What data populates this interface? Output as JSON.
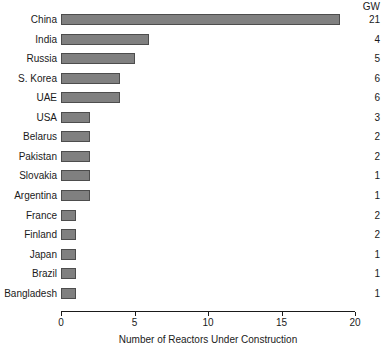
{
  "chart_data": {
    "type": "bar",
    "orientation": "horizontal",
    "title": "",
    "xlabel": "Number of Reactors Under Construction",
    "ylabel": "",
    "xlim": [
      0,
      20
    ],
    "xticks": [
      0,
      5,
      10,
      15,
      20
    ],
    "xtick_labels": [
      "0",
      "5",
      "10",
      "15",
      "20"
    ],
    "grid": false,
    "legend": null,
    "bar_color": "#808080",
    "bar_edge_color": "#4d4d4d",
    "value_column_header": "GW",
    "categories": [
      "China",
      "India",
      "Russia",
      "S. Korea",
      "UAE",
      "USA",
      "Belarus",
      "Pakistan",
      "Slovakia",
      "Argentina",
      "France",
      "Finland",
      "Japan",
      "Brazil",
      "Bangladesh"
    ],
    "values": [
      19,
      6,
      5,
      4,
      4,
      2,
      2,
      2,
      2,
      2,
      1,
      1,
      1,
      1,
      1
    ],
    "series": [
      {
        "name": "Number of Reactors Under Construction",
        "values": [
          19,
          6,
          5,
          4,
          4,
          2,
          2,
          2,
          2,
          2,
          1,
          1,
          1,
          1,
          1
        ]
      },
      {
        "name": "GW",
        "values": [
          21,
          4,
          5,
          6,
          6,
          3,
          2,
          2,
          1,
          1,
          2,
          2,
          1,
          1,
          1
        ]
      }
    ],
    "rows": [
      {
        "label": "China",
        "reactors": 19,
        "gw": "21"
      },
      {
        "label": "India",
        "reactors": 6,
        "gw": "4"
      },
      {
        "label": "Russia",
        "reactors": 5,
        "gw": "5"
      },
      {
        "label": "S. Korea",
        "reactors": 4,
        "gw": "6"
      },
      {
        "label": "UAE",
        "reactors": 4,
        "gw": "6"
      },
      {
        "label": "USA",
        "reactors": 2,
        "gw": "3"
      },
      {
        "label": "Belarus",
        "reactors": 2,
        "gw": "2"
      },
      {
        "label": "Pakistan",
        "reactors": 2,
        "gw": "2"
      },
      {
        "label": "Slovakia",
        "reactors": 2,
        "gw": "1"
      },
      {
        "label": "Argentina",
        "reactors": 2,
        "gw": "1"
      },
      {
        "label": "France",
        "reactors": 1,
        "gw": "2"
      },
      {
        "label": "Finland",
        "reactors": 1,
        "gw": "2"
      },
      {
        "label": "Japan",
        "reactors": 1,
        "gw": "1"
      },
      {
        "label": "Brazil",
        "reactors": 1,
        "gw": "1"
      },
      {
        "label": "Bangladesh",
        "reactors": 1,
        "gw": "1"
      }
    ]
  }
}
